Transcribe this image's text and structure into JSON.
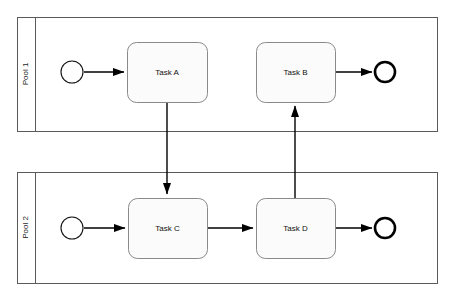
{
  "diagram": {
    "type": "bpmn-collaboration",
    "width": 453,
    "height": 299,
    "background_color": "#ffffff",
    "pools": [
      {
        "id": "pool1",
        "label": "Pool 1",
        "label_orientation": "vertical-rotated-90ccw",
        "frame": {
          "x": 17,
          "y": 17,
          "width": 420,
          "height": 114
        },
        "header_width": 18,
        "border_color": "#5a5a5a"
      },
      {
        "id": "pool2",
        "label": "Pool 2",
        "label_orientation": "vertical-rotated-90ccw",
        "frame": {
          "x": 17,
          "y": 172,
          "width": 420,
          "height": 111
        },
        "header_width": 18,
        "border_color": "#5a5a5a"
      }
    ],
    "events": [
      {
        "id": "start1",
        "kind": "start-event",
        "pool": "pool1",
        "cx": 72,
        "cy": 72,
        "r": 11,
        "stroke_width": 1.1,
        "stroke_color": "#111111",
        "fill_color": "#ffffff"
      },
      {
        "id": "end1",
        "kind": "end-event",
        "pool": "pool1",
        "cx": 385,
        "cy": 72,
        "r": 10,
        "stroke_width": 2.6,
        "stroke_color": "#000000",
        "fill_color": "#ffffff"
      },
      {
        "id": "start2",
        "kind": "start-event",
        "pool": "pool2",
        "cx": 72,
        "cy": 228,
        "r": 11,
        "stroke_width": 1.1,
        "stroke_color": "#111111",
        "fill_color": "#ffffff"
      },
      {
        "id": "end2",
        "kind": "end-event",
        "pool": "pool2",
        "cx": 385,
        "cy": 228,
        "r": 10,
        "stroke_width": 2.6,
        "stroke_color": "#000000",
        "fill_color": "#ffffff"
      }
    ],
    "tasks": [
      {
        "id": "taskA",
        "label": "Task A",
        "pool": "pool1",
        "x": 127,
        "y": 42,
        "width": 80,
        "height": 60,
        "corner_radius": 9,
        "fill_color": "#fbfbfb",
        "stroke_color": "#8a8a8a"
      },
      {
        "id": "taskB",
        "label": "Task B",
        "pool": "pool1",
        "x": 256,
        "y": 42,
        "width": 79,
        "height": 60,
        "corner_radius": 9,
        "fill_color": "#fbfbfb",
        "stroke_color": "#8a8a8a"
      },
      {
        "id": "taskC",
        "label": "Task C",
        "pool": "pool2",
        "x": 128,
        "y": 198,
        "width": 79,
        "height": 60,
        "corner_radius": 9,
        "fill_color": "#fbfbfb",
        "stroke_color": "#8a8a8a"
      },
      {
        "id": "taskD",
        "label": "Task D",
        "pool": "pool2",
        "x": 256,
        "y": 198,
        "width": 79,
        "height": 60,
        "corner_radius": 9,
        "fill_color": "#fbfbfb",
        "stroke_color": "#8a8a8a"
      }
    ],
    "flows": [
      {
        "id": "flow-start1-taskA",
        "kind": "sequence-flow",
        "from": "start1",
        "to": "taskA",
        "path": "M 84 72 L 124 72",
        "arrowhead": true
      },
      {
        "id": "flow-taskB-end1",
        "kind": "sequence-flow",
        "from": "taskB",
        "to": "end1",
        "path": "M 335 72 L 372 72",
        "arrowhead": true
      },
      {
        "id": "flow-start2-taskC",
        "kind": "sequence-flow",
        "from": "start2",
        "to": "taskC",
        "path": "M 84 228 L 125 228",
        "arrowhead": true
      },
      {
        "id": "flow-taskC-taskD",
        "kind": "sequence-flow",
        "from": "taskC",
        "to": "taskD",
        "path": "M 207 228 L 253 228",
        "arrowhead": true
      },
      {
        "id": "flow-taskD-end2",
        "kind": "sequence-flow",
        "from": "taskD",
        "to": "end2",
        "path": "M 335 228 L 372 228",
        "arrowhead": true
      },
      {
        "id": "flow-taskA-taskC",
        "kind": "message-flow",
        "from": "taskA",
        "to": "taskC",
        "path": "M 167 102 L 167 194",
        "arrowhead": true,
        "direction": "down",
        "crosses_pools": true
      },
      {
        "id": "flow-taskD-taskB",
        "kind": "message-flow",
        "from": "taskD",
        "to": "taskB",
        "path": "M 295 198 L 295 106",
        "arrowhead": true,
        "direction": "up",
        "crosses_pools": true
      }
    ]
  }
}
